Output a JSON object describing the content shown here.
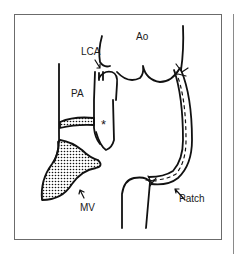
{
  "diagram": {
    "labels": {
      "lca": "LCA",
      "ao": "Ao",
      "pa": "PA",
      "asterisk": "*",
      "mv": "MV",
      "patch": "Patch"
    },
    "colors": {
      "stroke": "#111111",
      "frame": "#6b6b6b",
      "background": "#ffffff"
    }
  }
}
